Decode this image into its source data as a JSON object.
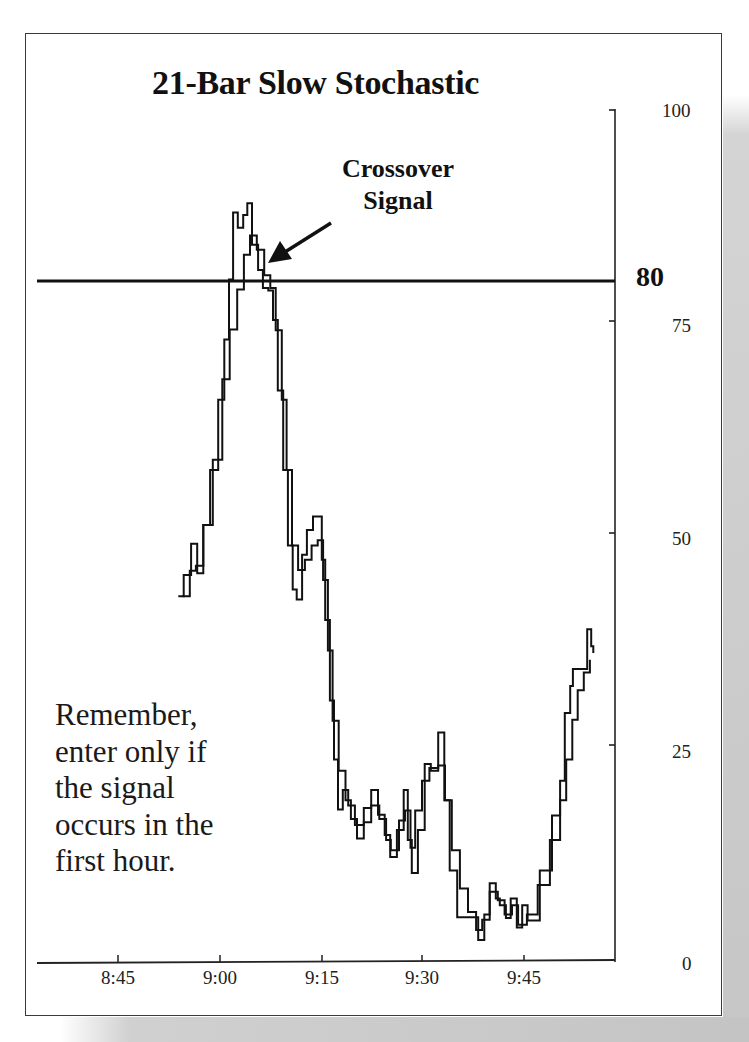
{
  "chart_data": {
    "type": "line",
    "title": "21-Bar Slow Stochastic",
    "xlabel": "",
    "ylabel": "",
    "ylim": [
      0,
      100
    ],
    "yticks": [
      0,
      25,
      50,
      75,
      100
    ],
    "xticks": [
      "8:45",
      "9:00",
      "9:15",
      "9:30",
      "9:45"
    ],
    "reference_line": {
      "value": 80,
      "label": "80"
    },
    "grid": false,
    "legend": null,
    "annotations": [
      {
        "text": "Crossover Signal",
        "target_time": "9:07",
        "target_value": 82
      },
      {
        "text": "Remember, enter only if the signal occurs in the first hour."
      }
    ],
    "x_unit": "minutes after 8:45",
    "series": [
      {
        "name": "%K (fast)",
        "points": [
          [
            8.9,
            42.6
          ],
          [
            9.7,
            45.1
          ],
          [
            10.8,
            48.8
          ],
          [
            11.7,
            45.3
          ],
          [
            12.6,
            51.0
          ],
          [
            13.6,
            57.5
          ],
          [
            14.8,
            65.8
          ],
          [
            15.7,
            72.9
          ],
          [
            16.4,
            80.0
          ],
          [
            17.0,
            87.9
          ],
          [
            17.7,
            86.1
          ],
          [
            18.5,
            87.6
          ],
          [
            19.1,
            89.0
          ],
          [
            19.8,
            84.1
          ],
          [
            20.7,
            81.1
          ],
          [
            21.4,
            79.0
          ],
          [
            22.2,
            78.7
          ],
          [
            22.9,
            75.2
          ],
          [
            23.6,
            66.9
          ],
          [
            24.4,
            57.5
          ],
          [
            25.1,
            48.6
          ],
          [
            25.8,
            43.4
          ],
          [
            26.4,
            42.2
          ],
          [
            27.2,
            47.5
          ],
          [
            27.9,
            50.4
          ],
          [
            28.8,
            52.0
          ],
          [
            29.5,
            52.0
          ],
          [
            30.1,
            46.9
          ],
          [
            30.6,
            39.8
          ],
          [
            31.3,
            30.3
          ],
          [
            31.9,
            23.3
          ],
          [
            32.5,
            17.4
          ],
          [
            33.2,
            19.7
          ],
          [
            34.0,
            17.9
          ],
          [
            35.0,
            15.6
          ],
          [
            36.3,
            17.6
          ],
          [
            37.4,
            19.7
          ],
          [
            38.4,
            16.8
          ],
          [
            39.4,
            14.4
          ],
          [
            40.2,
            11.8
          ],
          [
            41.2,
            15.0
          ],
          [
            42.2,
            19.7
          ],
          [
            42.8,
            13.8
          ],
          [
            43.4,
            9.9
          ],
          [
            44.3,
            15.0
          ],
          [
            45.3,
            22.8
          ],
          [
            46.2,
            22.0
          ],
          [
            47.3,
            26.5
          ],
          [
            48.2,
            18.5
          ],
          [
            49.0,
            10.2
          ],
          [
            50.1,
            4.7
          ],
          [
            51.4,
            4.7
          ],
          [
            52.3,
            4.7
          ],
          [
            53.2,
            2.0
          ],
          [
            54.1,
            5.0
          ],
          [
            54.9,
            8.7
          ],
          [
            55.8,
            6.9
          ],
          [
            56.4,
            6.1
          ],
          [
            57.3,
            4.6
          ],
          [
            58.0,
            6.9
          ],
          [
            58.9,
            3.5
          ],
          [
            59.7,
            6.1
          ],
          [
            60.5,
            4.3
          ],
          [
            62.3,
            10.2
          ],
          [
            64.1,
            16.7
          ],
          [
            65.3,
            20.8
          ],
          [
            66.0,
            28.8
          ],
          [
            66.8,
            32.0
          ],
          [
            67.2,
            34.0
          ],
          [
            68.5,
            34.0
          ],
          [
            69.3,
            38.7
          ],
          [
            69.9,
            36.7
          ],
          [
            70.2,
            35.9
          ]
        ]
      },
      {
        "name": "%D (slow)",
        "points": [
          [
            9.5,
            42.6
          ],
          [
            10.6,
            45.6
          ],
          [
            11.5,
            46.2
          ],
          [
            12.6,
            51.0
          ],
          [
            14.0,
            58.7
          ],
          [
            15.4,
            68.2
          ],
          [
            16.5,
            74.1
          ],
          [
            17.6,
            78.8
          ],
          [
            18.6,
            82.9
          ],
          [
            19.5,
            85.2
          ],
          [
            20.5,
            83.5
          ],
          [
            21.6,
            80.5
          ],
          [
            22.5,
            79.0
          ],
          [
            23.3,
            74.0
          ],
          [
            24.2,
            65.8
          ],
          [
            24.9,
            57.5
          ],
          [
            25.7,
            48.6
          ],
          [
            26.6,
            45.7
          ],
          [
            27.6,
            46.9
          ],
          [
            28.6,
            48.6
          ],
          [
            29.5,
            49.2
          ],
          [
            30.3,
            44.5
          ],
          [
            31.0,
            36.2
          ],
          [
            31.7,
            27.9
          ],
          [
            32.6,
            22.0
          ],
          [
            33.6,
            18.5
          ],
          [
            34.4,
            16.3
          ],
          [
            35.3,
            14.0
          ],
          [
            36.3,
            15.9
          ],
          [
            37.4,
            17.9
          ],
          [
            38.6,
            16.3
          ],
          [
            39.6,
            13.8
          ],
          [
            40.3,
            12.6
          ],
          [
            41.5,
            16.1
          ],
          [
            42.4,
            17.3
          ],
          [
            43.2,
            12.9
          ],
          [
            43.9,
            17.3
          ],
          [
            44.9,
            20.8
          ],
          [
            46.0,
            22.3
          ],
          [
            47.3,
            22.6
          ],
          [
            48.3,
            18.5
          ],
          [
            49.3,
            12.6
          ],
          [
            50.5,
            8.1
          ],
          [
            51.7,
            5.3
          ],
          [
            52.9,
            3.2
          ],
          [
            53.8,
            4.4
          ],
          [
            54.9,
            7.7
          ],
          [
            56.1,
            6.7
          ],
          [
            57.1,
            5.0
          ],
          [
            58.2,
            6.1
          ],
          [
            59.1,
            3.8
          ],
          [
            60.4,
            5.0
          ],
          [
            62.0,
            8.5
          ],
          [
            63.8,
            13.8
          ],
          [
            65.3,
            18.5
          ],
          [
            66.2,
            23.3
          ],
          [
            67.1,
            28.0
          ],
          [
            67.9,
            31.5
          ],
          [
            68.8,
            33.6
          ],
          [
            69.7,
            35.1
          ]
        ]
      }
    ]
  },
  "labels": {
    "title": "21-Bar Slow Stochastic",
    "annotation_line1": "Crossover",
    "annotation_line2": "Signal",
    "note_lines": [
      "Remember,",
      "enter only if",
      "the signal",
      "occurs in the",
      "first hour."
    ],
    "y100": "100",
    "y80": "80",
    "y75": "75",
    "y50": "50",
    "y25": "25",
    "y0": "0",
    "x845": "8:45",
    "x900": "9:00",
    "x915": "9:15",
    "x930": "9:30",
    "x945": "9:45"
  },
  "colors": {
    "line": "#111111",
    "frame": "#3a3a3a",
    "shadow": "#c6c6c6"
  }
}
